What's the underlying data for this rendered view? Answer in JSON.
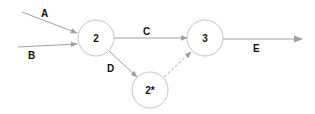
{
  "diagram": {
    "colors": {
      "edge": "#a0a0a0",
      "node_stroke": "#c4c4c4",
      "text": "#111111"
    },
    "nodes": [
      {
        "id": "2",
        "label": "2",
        "cx": 96,
        "cy": 38,
        "r": 18
      },
      {
        "id": "3",
        "label": "3",
        "cx": 205,
        "cy": 38,
        "r": 18
      },
      {
        "id": "2star",
        "label": "2*",
        "cx": 150,
        "cy": 90,
        "r": 18
      }
    ],
    "edges": [
      {
        "id": "A",
        "label": "A",
        "from": "external",
        "to": "2",
        "style": "solid"
      },
      {
        "id": "B",
        "label": "B",
        "from": "external",
        "to": "2",
        "style": "solid"
      },
      {
        "id": "C",
        "label": "C",
        "from": "2",
        "to": "3",
        "style": "solid"
      },
      {
        "id": "D",
        "label": "D",
        "from": "2",
        "to": "2*",
        "style": "solid"
      },
      {
        "id": "dashed",
        "label": "",
        "from": "2*",
        "to": "3",
        "style": "dashed"
      },
      {
        "id": "E",
        "label": "E",
        "from": "3",
        "to": "external",
        "style": "solid"
      }
    ]
  }
}
